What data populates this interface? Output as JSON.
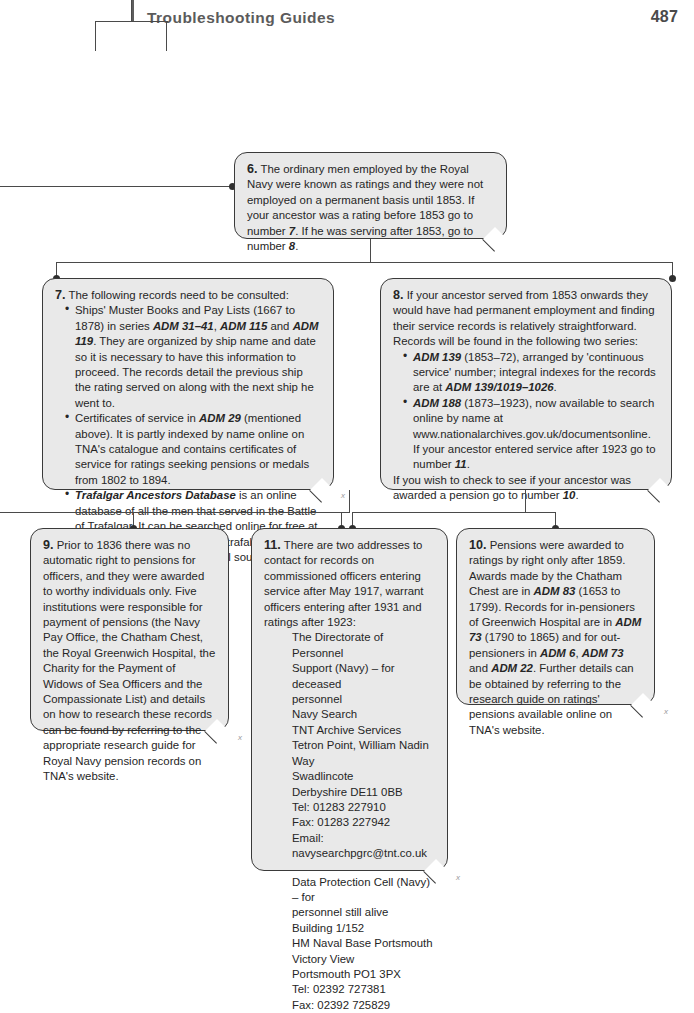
{
  "header": {
    "title": "Troubleshooting Guides",
    "page_number": "487"
  },
  "nodes": {
    "n6": {
      "number": "6.",
      "text": "The ordinary men employed by the Royal Navy were known as ratings and they were not employed on a permanent basis until 1853. If your ancestor was a rating before 1853 go to number ",
      "ref1": "7",
      "text2": ". If he was serving after 1853, go to number ",
      "ref2": "8",
      "text3": "."
    },
    "n7": {
      "number": "7.",
      "intro": "The following records need to be consulted:",
      "b1a": "Ships' Muster Books and Pay Lists (1667 to 1878) in series ",
      "b1_adm1": "ADM 31–41",
      "b1b": ", ",
      "b1_adm2": "ADM 115",
      "b1c": " and ",
      "b1_adm3": "ADM 119",
      "b1d": ". They are organized by ship name and date so it is necessary to have this information to proceed. The records detail the previous ship the rating served on along with the next ship he went to.",
      "b2a": "Certificates of service in ",
      "b2_adm": "ADM 29",
      "b2b": " (mentioned above). It is partly indexed by name online on TNA's catalogue and contains certificates of service for ratings seeking pensions or medals from 1802 to 1894.",
      "b3_title": "Trafalgar Ancestors Database",
      "b3a": " is an online database of all the men that served in the Battle of Trafalgar. It can be searched online for free at www.nationalarchives.gov.uk/ trafalgarancestors and will lead you to the original sources that contain information.",
      "xmark": "x"
    },
    "n8": {
      "number": "8.",
      "intro": "If your ancestor served from 1853 onwards they would have had permanent employment and finding their service records is relatively straightforward. Records will be found in the following two series:",
      "b1_adm": "ADM 139",
      "b1a": " (1853–72), arranged by 'continuous service' number; integral indexes for the records are at ",
      "b1_adm2": "ADM 139/1019–1026",
      "b1b": ".",
      "b2_adm": "ADM 188",
      "b2a": " (1873–1923), now available to search online by name at www.nationalarchives.gov.uk/documentsonline. If your ancestor entered service after 1923 go to number ",
      "b2_ref": "11",
      "b2b": ".",
      "outro_a": "If you wish to check to see if your ancestor was awarded a pension go to number ",
      "outro_ref": "10",
      "outro_b": "."
    },
    "n9": {
      "number": "9.",
      "text": "Prior to 1836 there was no automatic right to pensions for officers, and they were awarded to worthy individuals only. Five institutions were responsible for payment of pensions (the Navy Pay Office, the Chatham Chest, the Royal Greenwich Hospital, the Charity for the Payment of Widows of Sea Officers and the Compassionate List) and details on how to research these records can be found by referring to the appropriate research guide for Royal Navy pension records on TNA's website.",
      "xmark": "x"
    },
    "n11": {
      "number": "11.",
      "intro": "There are two addresses to contact for records on commissioned officers entering service after May 1917, warrant officers entering after 1931 and ratings after 1923:",
      "addr1": [
        "The Directorate of Personnel",
        "Support (Navy) – for deceased",
        "personnel",
        "Navy Search",
        "TNT Archive Services",
        "Tetron Point, William Nadin Way",
        "Swadlincote",
        "Derbyshire DE11 0BB",
        "Tel: 01283 227910",
        "Fax: 01283 227942",
        "Email: navysearchpgrc@tnt.co.uk"
      ],
      "addr2": [
        "Data Protection Cell (Navy) – for",
        "personnel still alive",
        "Building 1/152",
        "HM Naval Base Portsmouth",
        "Victory View",
        "Portsmouth PO1 3PX",
        "Tel: 02392 727381",
        "Fax: 02392 725829"
      ],
      "xmark": "x"
    },
    "n10": {
      "number": "10.",
      "a": "Pensions were awarded to ratings by right only after 1859. Awards made by the Chatham Chest are in ",
      "adm1": "ADM 83",
      "b": " (1653 to 1799). Records for in-pensioners of Greenwich Hospital are in ",
      "adm2": "ADM 73",
      "c": " (1790 to 1865) and for out-pensioners in ",
      "adm3": "ADM 6",
      "d": ", ",
      "adm4": "ADM 73",
      "e": " and ",
      "adm5": "ADM 22",
      "f": ". Further details can be obtained by referring to the research guide on ratings' pensions available online on TNA's website.",
      "xmark": "x"
    }
  },
  "colors": {
    "box_fill": "#e9e9e9",
    "box_stroke": "#3a3a3a",
    "connector": "#4a4a4a",
    "header_text": "#5b5b5b"
  }
}
